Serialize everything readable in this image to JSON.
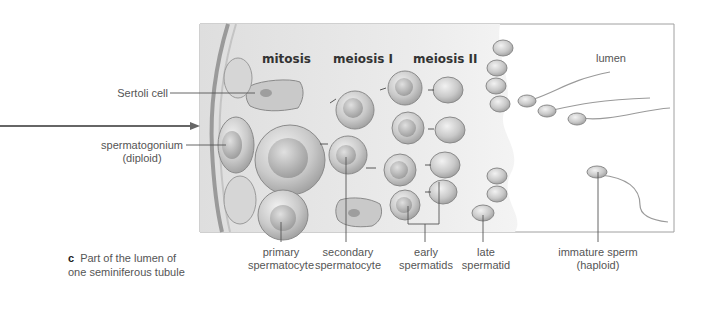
{
  "figure": {
    "panel_letter": "c",
    "caption": [
      "Part of the lumen of",
      "one seminiferous tubule"
    ],
    "stage_titles": {
      "mitosis": "mitosis",
      "meiosis1": "meiosis I",
      "meiosis2": "meiosis II"
    },
    "region_label": "lumen",
    "left_labels": {
      "sertoli": "Sertoli cell",
      "spermatogonium": [
        "spermatogonium",
        "(diploid)"
      ]
    },
    "bottom_labels": {
      "primary": [
        "primary",
        "spermatocyte"
      ],
      "secondary": [
        "secondary",
        "spermatocyte"
      ],
      "early": [
        "early",
        "spermatids"
      ],
      "late": [
        "late",
        "spermatid"
      ],
      "immature": [
        "immature sperm",
        "(haploid)"
      ]
    },
    "colors": {
      "tissue": "#e9e9e9",
      "cell_fill": "#cfcfcf",
      "cell_stroke": "#8a8a8a",
      "nucleus": "#b5b5b5",
      "line": "#555555",
      "frame": "#a0a0a0"
    }
  }
}
